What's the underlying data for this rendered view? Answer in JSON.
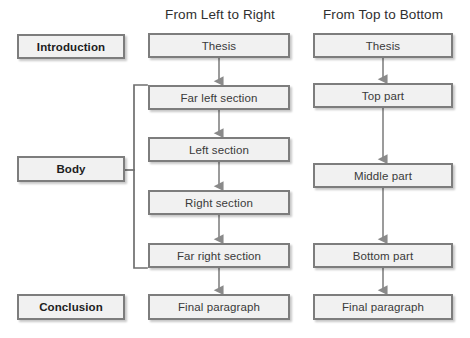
{
  "diagram": {
    "style": {
      "node_fill": "#f1f1f1",
      "node_border": "#7d7d7d",
      "arrow_color": "#8a8a8a",
      "text_color": "#3a3a3a",
      "background": "#ffffff"
    },
    "columns": [
      {
        "id": "stages",
        "header": "",
        "nodes": [
          {
            "id": "introduction",
            "label": "Introduction",
            "kind": "stage",
            "x": 17,
            "y": 34,
            "w": 108,
            "h": 25
          },
          {
            "id": "body",
            "label": "Body",
            "kind": "stage",
            "x": 17,
            "y": 156,
            "w": 108,
            "h": 26
          },
          {
            "id": "conclusion",
            "label": "Conclusion",
            "kind": "stage",
            "x": 17,
            "y": 294,
            "w": 108,
            "h": 26
          }
        ]
      },
      {
        "id": "left-to-right",
        "header": "From Left to Right",
        "header_x": 150,
        "header_y": 7,
        "header_w": 140,
        "nodes": [
          {
            "id": "ltr-thesis",
            "label": "Thesis",
            "kind": "item",
            "x": 148,
            "y": 33,
            "w": 142,
            "h": 25
          },
          {
            "id": "ltr-far-left",
            "label": "Far left section",
            "kind": "item",
            "x": 148,
            "y": 85,
            "w": 142,
            "h": 25
          },
          {
            "id": "ltr-left",
            "label": "Left section",
            "kind": "item",
            "x": 148,
            "y": 137,
            "w": 142,
            "h": 25
          },
          {
            "id": "ltr-right",
            "label": "Right section",
            "kind": "item",
            "x": 148,
            "y": 190,
            "w": 142,
            "h": 25
          },
          {
            "id": "ltr-far-right",
            "label": "Far right section",
            "kind": "item",
            "x": 148,
            "y": 243,
            "w": 142,
            "h": 25
          },
          {
            "id": "ltr-final",
            "label": "Final paragraph",
            "kind": "item",
            "x": 148,
            "y": 294,
            "w": 142,
            "h": 26
          }
        ]
      },
      {
        "id": "top-to-bottom",
        "header": "From Top to Bottom",
        "header_x": 313,
        "header_y": 7,
        "header_w": 140,
        "nodes": [
          {
            "id": "ttb-thesis",
            "label": "Thesis",
            "kind": "item",
            "x": 313,
            "y": 33,
            "w": 140,
            "h": 25
          },
          {
            "id": "ttb-top",
            "label": "Top part",
            "kind": "item",
            "x": 313,
            "y": 83,
            "w": 140,
            "h": 25
          },
          {
            "id": "ttb-middle",
            "label": "Middle part",
            "kind": "item",
            "x": 313,
            "y": 163,
            "w": 140,
            "h": 25
          },
          {
            "id": "ttb-bottom",
            "label": "Bottom part",
            "kind": "item",
            "x": 313,
            "y": 243,
            "w": 140,
            "h": 25
          },
          {
            "id": "ttb-final",
            "label": "Final paragraph",
            "kind": "item",
            "x": 313,
            "y": 294,
            "w": 140,
            "h": 26
          }
        ]
      }
    ],
    "arrows": [
      {
        "from": "ltr-thesis",
        "to": "ltr-far-left",
        "x": 219,
        "y1": 58,
        "y2": 85
      },
      {
        "from": "ltr-far-left",
        "to": "ltr-left",
        "x": 219,
        "y1": 110,
        "y2": 137
      },
      {
        "from": "ltr-left",
        "to": "ltr-right",
        "x": 219,
        "y1": 162,
        "y2": 190
      },
      {
        "from": "ltr-right",
        "to": "ltr-far-right",
        "x": 219,
        "y1": 215,
        "y2": 243
      },
      {
        "from": "ltr-far-right",
        "to": "ltr-final",
        "x": 219,
        "y1": 268,
        "y2": 294
      },
      {
        "from": "ttb-thesis",
        "to": "ttb-top",
        "x": 383,
        "y1": 58,
        "y2": 83
      },
      {
        "from": "ttb-top",
        "to": "ttb-middle",
        "x": 383,
        "y1": 108,
        "y2": 163
      },
      {
        "from": "ttb-middle",
        "to": "ttb-bottom",
        "x": 383,
        "y1": 188,
        "y2": 243
      },
      {
        "from": "ttb-bottom",
        "to": "ttb-final",
        "x": 383,
        "y1": 268,
        "y2": 294
      }
    ],
    "bracket": {
      "from": "body",
      "to_group": "left-to-right body sections",
      "spine_x": 134,
      "top_y": 85,
      "bottom_y": 268,
      "stub_right_x": 147,
      "connector_y": 170,
      "connector_left_x": 125
    }
  }
}
